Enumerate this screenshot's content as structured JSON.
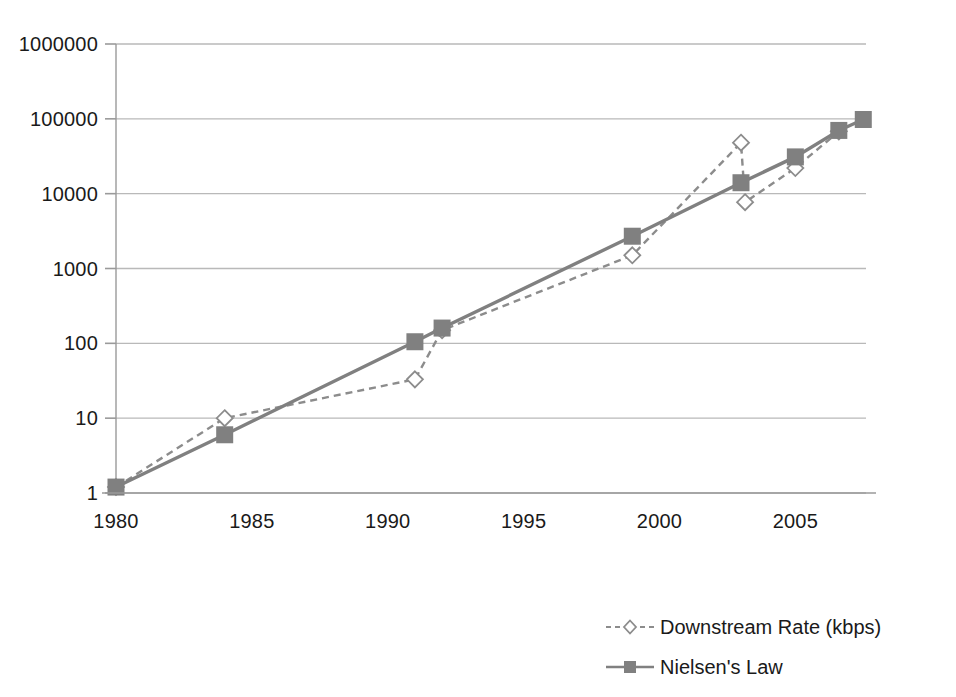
{
  "chart_data": {
    "type": "line",
    "title": "",
    "xlabel": "",
    "ylabel": "",
    "log_y": true,
    "xlim": [
      1980,
      2007.6
    ],
    "ylim": [
      1,
      1000000
    ],
    "grid": true,
    "y_ticks": [
      "1",
      "10",
      "100",
      "1000",
      "10000",
      "100000",
      "1000000"
    ],
    "y_tick_values": [
      1,
      10,
      100,
      1000,
      10000,
      100000,
      1000000
    ],
    "x_ticks": [
      "1980",
      "1985",
      "1990",
      "1995",
      "2000",
      "2005"
    ],
    "x_tick_values": [
      1980,
      1985,
      1990,
      1995,
      2000,
      2005
    ],
    "legend_position": "bottom-right",
    "series": [
      {
        "name": "Downstream Rate (kbps)",
        "marker": "open-diamond",
        "line": "dashed",
        "color": "#8c8c8c",
        "points": [
          {
            "x": 1980,
            "y": 1.2
          },
          {
            "x": 1984,
            "y": 10
          },
          {
            "x": 1991,
            "y": 33
          },
          {
            "x": 1992,
            "y": 150
          },
          {
            "x": 1999,
            "y": 1500
          },
          {
            "x": 2003,
            "y": 48000
          },
          {
            "x": 2003.15,
            "y": 7700
          },
          {
            "x": 2005,
            "y": 22000
          },
          {
            "x": 2006.6,
            "y": 68000
          }
        ]
      },
      {
        "name": "Nielsen's Law",
        "marker": "filled-square",
        "line": "solid",
        "color": "#808080",
        "points": [
          {
            "x": 1980,
            "y": 1.2
          },
          {
            "x": 1984,
            "y": 6
          },
          {
            "x": 1991,
            "y": 105
          },
          {
            "x": 1992,
            "y": 160
          },
          {
            "x": 1999,
            "y": 2700
          },
          {
            "x": 2003,
            "y": 14000
          },
          {
            "x": 2005,
            "y": 31000
          },
          {
            "x": 2006.6,
            "y": 70000
          },
          {
            "x": 2007.5,
            "y": 98000
          }
        ]
      }
    ]
  },
  "legend": {
    "items": [
      {
        "label": "Downstream Rate (kbps)"
      },
      {
        "label": "Nielsen's Law"
      }
    ]
  },
  "colors": {
    "series_gray": "#808080",
    "grid": "#b9b9b9",
    "axis": "#9a9a9a",
    "text": "#1a1a1a"
  }
}
